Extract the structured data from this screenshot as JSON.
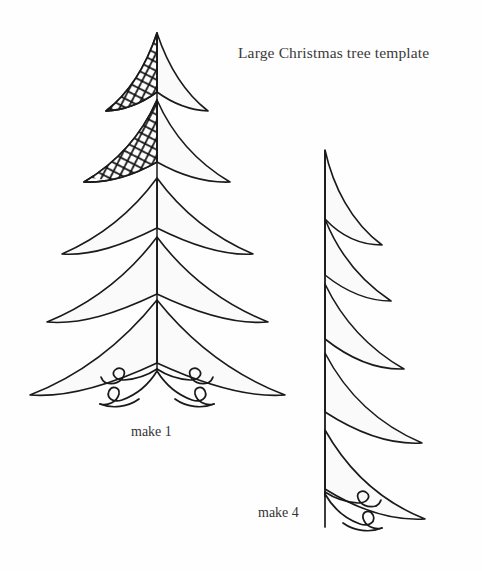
{
  "page": {
    "background_color": "#fefefe",
    "width": 482,
    "height": 571,
    "kind": "craft-template-worksheet"
  },
  "title": {
    "text": "Large Christmas tree template"
  },
  "labels": {
    "left_tree": "make 1",
    "right_tree": "make 4"
  },
  "style": {
    "ink_color": "#1a1a1a",
    "branch_fill": "#fafafa",
    "mesh_color": "#111111",
    "stroke_width": 1.6
  },
  "figures": [
    {
      "id": "full-tree",
      "name": "large-christmas-tree-full",
      "quantity_label": "make 1",
      "quantity": 1,
      "symmetry": "bilateral",
      "tier_count": 5,
      "apex": [
        157,
        33
      ],
      "base_y": 397,
      "textured_tiers": [
        1,
        2
      ],
      "texture": "diagonal-net-mesh",
      "textured_side": "left",
      "has_scroll_base": true,
      "scroll_base": "full-symmetric-scroll"
    },
    {
      "id": "half-tree",
      "name": "large-christmas-tree-half",
      "quantity_label": "make 4",
      "quantity": 4,
      "symmetry": "half-right",
      "tier_count": 5,
      "apex": [
        325,
        150
      ],
      "base_y": 522,
      "textured_tiers": [],
      "texture": "none",
      "has_scroll_base": true,
      "scroll_base": "half-right-scroll"
    }
  ]
}
